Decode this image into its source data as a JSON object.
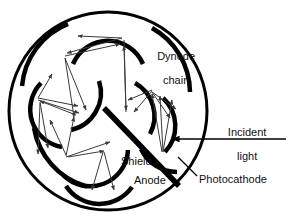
{
  "figure": {
    "type": "cross-section-schematic",
    "background_color": "#ffffff",
    "stroke_color": "#000000"
  },
  "labels": {
    "dynode_chain": "Dynode\nchain",
    "dynode_chain_line1": "Dynode",
    "dynode_chain_line2": "chain",
    "incident_light": "Incident\nlight",
    "incident_light_line1": "Incident",
    "incident_light_line2": "light",
    "shield": "Shield",
    "anode": "Anode",
    "photocathode": "Photocathode"
  },
  "geometry": {
    "envelope": {
      "name": "tube-envelope-circle",
      "cx": 108,
      "cy": 111,
      "r": 99,
      "stroke_width": 3
    },
    "shield_bar": {
      "name": "shield-bar",
      "x1": 104,
      "y1": 108,
      "x2": 179,
      "y2": 186,
      "stroke_width": 5
    },
    "incident_light_ray": {
      "x1": 286,
      "y1": 139,
      "x2": 172,
      "y2": 139,
      "stroke_width": 1.4
    },
    "photocathode_leader": {
      "x1": 197,
      "y1": 176,
      "x2": 179,
      "y2": 158,
      "stroke_width": 1.2
    },
    "dynode_arc_count": 9,
    "symmetry_fold": 3,
    "arc_stroke_width": 4,
    "trajectory_arrow_stroke_width": 1
  },
  "colors": {
    "ink": "#000000",
    "paper": "#ffffff",
    "arrow": "#3a3a3a"
  }
}
